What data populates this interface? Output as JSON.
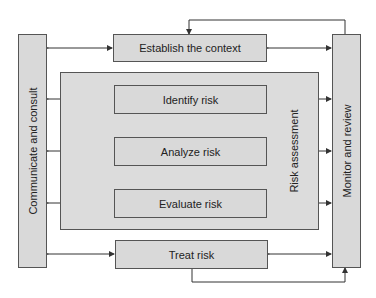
{
  "diagram": {
    "left_column": {
      "label": "Communicate and consult"
    },
    "right_column": {
      "label": "Monitor and review"
    },
    "context_box": {
      "label": "Establish the context"
    },
    "assessment_group": {
      "label": "Risk assessment",
      "steps": [
        {
          "label": "Identify risk"
        },
        {
          "label": "Analyze risk"
        },
        {
          "label": "Evaluate risk"
        }
      ]
    },
    "treat_box": {
      "label": "Treat risk"
    },
    "colors": {
      "box_fill": "#d9d9d9",
      "border": "#555555",
      "line": "#333333",
      "background": "#ffffff"
    }
  }
}
